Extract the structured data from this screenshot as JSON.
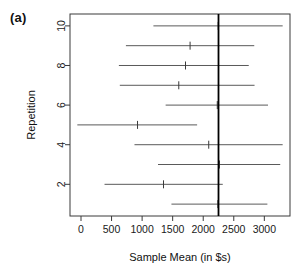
{
  "panel": {
    "label": "(a)"
  },
  "chart_data": {
    "type": "scatter",
    "title": "",
    "xlabel": "Sample Mean (in $s)",
    "ylabel": "Repetition",
    "xlim": [
      -180,
      3420
    ],
    "ylim": [
      0.4,
      10.6
    ],
    "grid": false,
    "legend": "none",
    "xticks": [
      0,
      500,
      1000,
      1500,
      2000,
      2500,
      3000
    ],
    "xticklabels": [
      "0",
      "500",
      "1000",
      "1500",
      "2000",
      "2500",
      "3000"
    ],
    "yticks": [
      2,
      4,
      6,
      8,
      10
    ],
    "yticklabels": [
      "2",
      "4",
      "6",
      "8",
      "10"
    ],
    "reference_line": {
      "orientation": "vertical",
      "value": 2250,
      "label": ""
    },
    "categories": [
      1,
      2,
      3,
      4,
      5,
      6,
      7,
      8,
      9,
      10
    ],
    "series": [
      {
        "name": "Confidence intervals by repetition",
        "points": [
          {
            "repetition": 1,
            "mean": 2240,
            "lower": 1480,
            "upper": 3050
          },
          {
            "repetition": 2,
            "mean": 1350,
            "lower": 385,
            "upper": 2320
          },
          {
            "repetition": 3,
            "mean": 2265,
            "lower": 1260,
            "upper": 3260
          },
          {
            "repetition": 4,
            "mean": 2090,
            "lower": 875,
            "upper": 3300
          },
          {
            "repetition": 5,
            "mean": 925,
            "lower": -60,
            "upper": 1900
          },
          {
            "repetition": 6,
            "mean": 2230,
            "lower": 1385,
            "upper": 3060
          },
          {
            "repetition": 7,
            "mean": 1600,
            "lower": 635,
            "upper": 2840
          },
          {
            "repetition": 8,
            "mean": 1710,
            "lower": 620,
            "upper": 2745
          },
          {
            "repetition": 9,
            "mean": 1785,
            "lower": 735,
            "upper": 2835
          },
          {
            "repetition": 10,
            "mean": 2245,
            "lower": 1185,
            "upper": 3300
          }
        ]
      }
    ]
  }
}
